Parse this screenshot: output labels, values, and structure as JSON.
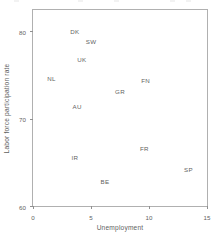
{
  "chart_data": {
    "type": "scatter",
    "title": "",
    "xlabel": "Unemployment",
    "ylabel": "Labor force participation rate",
    "xlim": [
      0,
      15
    ],
    "ylim": [
      60,
      82.4
    ],
    "xticks": [
      0,
      5,
      10,
      15
    ],
    "xtick_labels": [
      "0",
      "5",
      "10",
      "15"
    ],
    "yticks": [
      60,
      70,
      80
    ],
    "ytick_labels": [
      "60",
      "70",
      "80"
    ],
    "grid": false,
    "legend": "none",
    "marker": "text-label",
    "points": [
      {
        "label": "DK",
        "x": 3.6,
        "y": 80.0
      },
      {
        "label": "SW",
        "x": 5.0,
        "y": 78.9
      },
      {
        "label": "UK",
        "x": 4.2,
        "y": 76.8
      },
      {
        "label": "NL",
        "x": 1.6,
        "y": 74.6
      },
      {
        "label": "FN",
        "x": 9.7,
        "y": 74.4
      },
      {
        "label": "GR",
        "x": 7.5,
        "y": 73.2
      },
      {
        "label": "AU",
        "x": 3.8,
        "y": 71.4
      },
      {
        "label": "FR",
        "x": 9.6,
        "y": 66.6
      },
      {
        "label": "IR",
        "x": 3.6,
        "y": 65.6
      },
      {
        "label": "SP",
        "x": 13.4,
        "y": 64.2
      },
      {
        "label": "BE",
        "x": 6.2,
        "y": 62.9
      }
    ]
  },
  "colors": {
    "axis": "#b0b0b0",
    "text": "#5f5f5f",
    "background": "#ffffff"
  }
}
